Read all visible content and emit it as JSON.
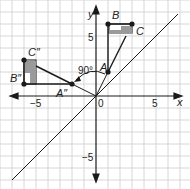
{
  "diagram": {
    "title": "",
    "axes": {
      "x_label": "x",
      "y_label": "y",
      "origin_label": "0"
    },
    "ticks": {
      "x_neg": "−5",
      "x_pos": "5",
      "y_pos": "5",
      "y_neg": "−5"
    },
    "angle_label": "90°",
    "points": {
      "A": {
        "label": "A",
        "x": 1,
        "y": 2
      },
      "B": {
        "label": "B",
        "x": 1,
        "y": 6
      },
      "C": {
        "label": "C",
        "x": 3,
        "y": 6
      },
      "A2": {
        "label": "A″",
        "x": -2,
        "y": 1
      },
      "B2": {
        "label": "B″",
        "x": -6,
        "y": 1
      },
      "C2": {
        "label": "C″",
        "x": -6,
        "y": 3
      }
    },
    "reference_line": "y = x",
    "colors": {
      "grid": "#d6d6d6",
      "line": "#1a1a1a",
      "fill": "#9a9a9a"
    }
  }
}
